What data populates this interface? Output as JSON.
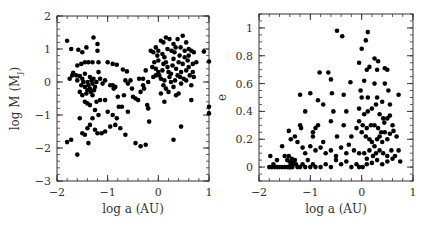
{
  "chart_data": [
    {
      "type": "scatter",
      "title": "",
      "xlabel": "log a (AU)",
      "ylabel": "log M (M_J)",
      "ylabel_main": "log M (M",
      "ylabel_sub": "J",
      "ylabel_close": ")",
      "xlim": [
        -2,
        1
      ],
      "ylim": [
        -3,
        2
      ],
      "xticks": [
        -2,
        -1,
        0,
        1
      ],
      "xtick_labels": [
        "−2",
        "−1",
        "0",
        "1"
      ],
      "yticks": [
        -3,
        -2,
        -1,
        0,
        1,
        2
      ],
      "ytick_labels": [
        "−3",
        "−2",
        "−1",
        "0",
        "1",
        "2"
      ],
      "grid": false,
      "legend": null,
      "marker_color": "#000000",
      "points": [
        [
          -1.8,
          1.25
        ],
        [
          -1.72,
          1.0
        ],
        [
          -1.58,
          0.98
        ],
        [
          -1.5,
          0.9
        ],
        [
          -1.42,
          1.05
        ],
        [
          -1.28,
          1.35
        ],
        [
          -1.2,
          1.15
        ],
        [
          -1.2,
          0.95
        ],
        [
          -1.6,
          0.5
        ],
        [
          -1.52,
          0.55
        ],
        [
          -1.45,
          0.6
        ],
        [
          -1.38,
          0.6
        ],
        [
          -1.3,
          0.6
        ],
        [
          -1.18,
          0.6
        ],
        [
          -1.0,
          0.6
        ],
        [
          -0.9,
          0.55
        ],
        [
          -0.82,
          0.52
        ],
        [
          -0.7,
          0.38
        ],
        [
          -0.62,
          0.32
        ],
        [
          -1.68,
          0.28
        ],
        [
          -1.62,
          0.2
        ],
        [
          -1.55,
          0.18
        ],
        [
          -1.5,
          0.1
        ],
        [
          -1.45,
          0.25
        ],
        [
          -1.4,
          0.0
        ],
        [
          -1.38,
          -0.1
        ],
        [
          -1.35,
          -0.2
        ],
        [
          -1.33,
          -0.3
        ],
        [
          -1.42,
          -0.35
        ],
        [
          -1.3,
          -0.05
        ],
        [
          -1.28,
          0.1
        ],
        [
          -1.25,
          -0.15
        ],
        [
          -1.35,
          0.15
        ],
        [
          -1.32,
          0.05
        ],
        [
          -1.4,
          -0.25
        ],
        [
          -1.3,
          -0.4
        ],
        [
          -1.27,
          -0.25
        ],
        [
          -1.45,
          -0.15
        ],
        [
          -1.48,
          0.0
        ],
        [
          -1.52,
          -0.1
        ],
        [
          -1.22,
          0.0
        ],
        [
          -1.18,
          0.3
        ],
        [
          -1.15,
          0.1
        ],
        [
          -1.1,
          -0.05
        ],
        [
          -1.05,
          0.05
        ],
        [
          -1.75,
          0.1
        ],
        [
          -1.7,
          0.2
        ],
        [
          -1.6,
          0.05
        ],
        [
          -1.55,
          -0.3
        ],
        [
          -1.5,
          -0.4
        ],
        [
          -1.45,
          -0.6
        ],
        [
          -1.4,
          -0.65
        ],
        [
          -1.35,
          -0.7
        ],
        [
          -1.22,
          -0.6
        ],
        [
          -1.15,
          -0.55
        ],
        [
          -1.05,
          -0.55
        ],
        [
          -0.95,
          -0.1
        ],
        [
          -0.9,
          -0.1
        ],
        [
          -0.88,
          -0.2
        ],
        [
          -0.85,
          -0.15
        ],
        [
          -0.8,
          -0.45
        ],
        [
          -0.78,
          -0.75
        ],
        [
          -0.72,
          -0.75
        ],
        [
          -0.68,
          -0.4
        ],
        [
          -0.65,
          0.05
        ],
        [
          -0.6,
          -0.05
        ],
        [
          -0.55,
          0.05
        ],
        [
          -0.52,
          -0.2
        ],
        [
          -0.5,
          -0.45
        ],
        [
          -0.45,
          -0.5
        ],
        [
          -0.4,
          -0.55
        ],
        [
          -0.38,
          0.1
        ],
        [
          -0.3,
          0.1
        ],
        [
          -0.28,
          -0.2
        ],
        [
          -0.22,
          -0.7
        ],
        [
          -0.2,
          -0.8
        ],
        [
          -0.18,
          -1.2
        ],
        [
          -0.25,
          -1.9
        ],
        [
          -0.35,
          -1.95
        ],
        [
          -0.45,
          -1.85
        ],
        [
          -0.65,
          -1.6
        ],
        [
          -0.75,
          -1.4
        ],
        [
          -0.85,
          -1.3
        ],
        [
          -0.9,
          -1.0
        ],
        [
          -0.95,
          -1.35
        ],
        [
          -1.0,
          -0.9
        ],
        [
          -1.05,
          -1.5
        ],
        [
          -1.12,
          -1.55
        ],
        [
          -1.2,
          -1.55
        ],
        [
          -1.25,
          -1.45
        ],
        [
          -1.3,
          -1.1
        ],
        [
          -1.35,
          -1.3
        ],
        [
          -1.4,
          -1.4
        ],
        [
          -1.45,
          -1.6
        ],
        [
          -1.5,
          -1.55
        ],
        [
          -1.38,
          -1.85
        ],
        [
          -1.55,
          -1.1
        ],
        [
          -1.6,
          -2.2
        ],
        [
          -1.72,
          -1.75
        ],
        [
          -1.8,
          -1.82
        ],
        [
          -1.25,
          -0.85
        ],
        [
          -1.18,
          -1.0
        ],
        [
          -0.82,
          -1.1
        ],
        [
          -0.6,
          -0.9
        ],
        [
          -0.05,
          1.05
        ],
        [
          0.0,
          0.95
        ],
        [
          0.05,
          1.25
        ],
        [
          0.1,
          1.2
        ],
        [
          0.15,
          1.35
        ],
        [
          0.22,
          1.3
        ],
        [
          0.3,
          1.15
        ],
        [
          0.38,
          1.3
        ],
        [
          0.48,
          1.4
        ],
        [
          0.55,
          1.2
        ],
        [
          0.6,
          1.0
        ],
        [
          0.65,
          0.95
        ],
        [
          0.7,
          0.9
        ],
        [
          0.9,
          0.92
        ],
        [
          1.0,
          0.62
        ],
        [
          0.75,
          0.6
        ],
        [
          0.68,
          0.55
        ],
        [
          0.6,
          0.45
        ],
        [
          -0.15,
          0.95
        ],
        [
          -0.1,
          0.9
        ],
        [
          -0.02,
          0.8
        ],
        [
          -0.08,
          0.6
        ],
        [
          -0.05,
          0.4
        ],
        [
          0.0,
          0.3
        ],
        [
          0.02,
          0.2
        ],
        [
          0.05,
          0.1
        ],
        [
          0.08,
          0.35
        ],
        [
          0.1,
          0.55
        ],
        [
          0.12,
          0.75
        ],
        [
          0.15,
          0.6
        ],
        [
          0.18,
          0.45
        ],
        [
          0.2,
          0.3
        ],
        [
          0.22,
          0.15
        ],
        [
          0.25,
          0.0
        ],
        [
          0.28,
          0.5
        ],
        [
          0.3,
          0.7
        ],
        [
          0.32,
          0.9
        ],
        [
          0.35,
          0.4
        ],
        [
          0.38,
          0.2
        ],
        [
          0.4,
          0.6
        ],
        [
          0.42,
          0.8
        ],
        [
          0.45,
          0.3
        ],
        [
          0.48,
          0.55
        ],
        [
          0.5,
          0.1
        ],
        [
          0.52,
          0.75
        ],
        [
          0.55,
          0.35
        ],
        [
          0.58,
          0.65
        ],
        [
          0.62,
          0.2
        ],
        [
          0.65,
          -0.1
        ],
        [
          0.68,
          0.3
        ],
        [
          0.1,
          -0.1
        ],
        [
          0.15,
          -0.2
        ],
        [
          0.2,
          -0.3
        ],
        [
          0.3,
          -0.15
        ],
        [
          0.35,
          -0.4
        ],
        [
          0.4,
          -0.35
        ],
        [
          0.45,
          -0.05
        ],
        [
          0.55,
          0.05
        ],
        [
          0.05,
          -0.35
        ],
        [
          -0.05,
          0.2
        ],
        [
          -0.1,
          0.15
        ],
        [
          -0.12,
          0.45
        ],
        [
          0.0,
          0.65
        ],
        [
          0.08,
          0.85
        ],
        [
          0.18,
          1.0
        ],
        [
          0.26,
          0.95
        ],
        [
          0.34,
          1.05
        ],
        [
          0.44,
          1.05
        ],
        [
          0.52,
          0.95
        ],
        [
          0.25,
          0.25
        ],
        [
          0.33,
          0.05
        ],
        [
          0.43,
          0.15
        ],
        [
          0.12,
          0.05
        ],
        [
          0.6,
          0.8
        ],
        [
          0.7,
          0.15
        ],
        [
          0.12,
          -0.6
        ],
        [
          0.65,
          -0.55
        ],
        [
          0.45,
          -1.35
        ],
        [
          0.3,
          -1.75
        ],
        [
          1.0,
          -0.75
        ],
        [
          1.0,
          -0.95
        ],
        [
          -0.3,
          -0.1
        ],
        [
          -0.35,
          -0.3
        ],
        [
          -0.2,
          0.0
        ],
        [
          -0.25,
          0.35
        ]
      ]
    },
    {
      "type": "scatter",
      "title": "",
      "xlabel": "log a (AU)",
      "ylabel": "e",
      "xlim": [
        -2,
        1
      ],
      "ylim": [
        -0.1,
        1.1
      ],
      "xticks": [
        -2,
        -1,
        0,
        1
      ],
      "xtick_labels": [
        "−2",
        "−1",
        "0",
        "1"
      ],
      "yticks": [
        0,
        0.2,
        0.4,
        0.6,
        0.8,
        1
      ],
      "ytick_labels": [
        "0",
        "0.2",
        "0.4",
        "0.6",
        "0.8",
        "1"
      ],
      "grid": false,
      "legend": null,
      "marker_color": "#000000",
      "points": [
        [
          -0.48,
          0.98
        ],
        [
          -0.38,
          0.94
        ],
        [
          0.12,
          0.97
        ],
        [
          0.08,
          0.91
        ],
        [
          0.0,
          0.85
        ],
        [
          -0.05,
          0.75
        ],
        [
          0.25,
          0.78
        ],
        [
          0.32,
          0.76
        ],
        [
          -0.82,
          0.68
        ],
        [
          -0.65,
          0.68
        ],
        [
          -0.6,
          0.63
        ],
        [
          -0.22,
          0.61
        ],
        [
          0.05,
          0.62
        ],
        [
          0.1,
          0.7
        ],
        [
          0.15,
          0.72
        ],
        [
          0.3,
          0.7
        ],
        [
          0.45,
          0.71
        ],
        [
          0.5,
          0.7
        ],
        [
          0.72,
          0.52
        ],
        [
          -1.2,
          0.52
        ],
        [
          -1.0,
          0.53
        ],
        [
          -0.58,
          0.53
        ],
        [
          -0.35,
          0.52
        ],
        [
          0.0,
          0.5
        ],
        [
          -0.85,
          0.48
        ],
        [
          -0.75,
          0.45
        ],
        [
          -0.55,
          0.4
        ],
        [
          -0.3,
          0.4
        ],
        [
          -1.1,
          0.4
        ],
        [
          -0.05,
          0.42
        ],
        [
          0.05,
          0.38
        ],
        [
          0.12,
          0.4
        ],
        [
          0.2,
          0.42
        ],
        [
          0.28,
          0.45
        ],
        [
          0.35,
          0.38
        ],
        [
          0.42,
          0.35
        ],
        [
          0.55,
          0.37
        ],
        [
          0.6,
          0.3
        ],
        [
          -1.2,
          0.3
        ],
        [
          -1.18,
          0.28
        ],
        [
          -0.9,
          0.28
        ],
        [
          -0.95,
          0.25
        ],
        [
          -0.85,
          0.3
        ],
        [
          -0.6,
          0.33
        ],
        [
          -0.35,
          0.3
        ],
        [
          -0.48,
          0.22
        ],
        [
          -0.2,
          0.22
        ],
        [
          -0.1,
          0.28
        ],
        [
          0.0,
          0.25
        ],
        [
          0.08,
          0.22
        ],
        [
          0.15,
          0.2
        ],
        [
          0.2,
          0.18
        ],
        [
          0.25,
          0.15
        ],
        [
          0.3,
          0.2
        ],
        [
          0.35,
          0.22
        ],
        [
          0.4,
          0.18
        ],
        [
          0.45,
          0.25
        ],
        [
          0.5,
          0.2
        ],
        [
          0.55,
          0.24
        ],
        [
          0.62,
          0.26
        ],
        [
          0.68,
          0.22
        ],
        [
          0.72,
          0.12
        ],
        [
          0.75,
          0.04
        ],
        [
          -1.42,
          0.26
        ],
        [
          -1.38,
          0.2
        ],
        [
          -1.3,
          0.22
        ],
        [
          -1.25,
          0.18
        ],
        [
          -1.15,
          0.14
        ],
        [
          -1.1,
          0.1
        ],
        [
          -1.0,
          0.15
        ],
        [
          -0.9,
          0.12
        ],
        [
          -0.8,
          0.14
        ],
        [
          -0.7,
          0.1
        ],
        [
          -0.6,
          0.12
        ],
        [
          -0.5,
          0.08
        ],
        [
          -0.4,
          0.14
        ],
        [
          -0.3,
          0.1
        ],
        [
          -0.25,
          0.16
        ],
        [
          -0.15,
          0.12
        ],
        [
          -0.05,
          0.1
        ],
        [
          0.05,
          0.1
        ],
        [
          0.1,
          0.06
        ],
        [
          0.15,
          0.12
        ],
        [
          0.22,
          0.08
        ],
        [
          0.28,
          0.1
        ],
        [
          0.35,
          0.12
        ],
        [
          0.42,
          0.1
        ],
        [
          0.5,
          0.08
        ],
        [
          0.58,
          0.12
        ],
        [
          0.65,
          0.08
        ],
        [
          -1.78,
          0.08
        ],
        [
          -1.72,
          0.02
        ],
        [
          -1.65,
          0.05
        ],
        [
          -1.55,
          0.15
        ],
        [
          -1.5,
          0.08
        ],
        [
          -1.45,
          0.05
        ],
        [
          -1.42,
          0.08
        ],
        [
          -1.4,
          0.04
        ],
        [
          -1.38,
          0.02
        ],
        [
          -1.36,
          0.06
        ],
        [
          -1.35,
          0.0
        ],
        [
          -1.33,
          0.03
        ],
        [
          -1.3,
          0.05
        ],
        [
          -1.28,
          0.02
        ],
        [
          -1.8,
          0.0
        ],
        [
          -1.75,
          0.0
        ],
        [
          -1.7,
          0.0
        ],
        [
          -1.65,
          0.0
        ],
        [
          -1.6,
          0.0
        ],
        [
          -1.55,
          0.0
        ],
        [
          -1.5,
          0.0
        ],
        [
          -1.45,
          0.0
        ],
        [
          -1.42,
          0.0
        ],
        [
          -1.4,
          0.0
        ],
        [
          -1.38,
          0.0
        ],
        [
          -1.35,
          0.02
        ],
        [
          -1.25,
          0.0
        ],
        [
          -1.2,
          0.0
        ],
        [
          -1.15,
          0.02
        ],
        [
          -1.1,
          0.0
        ],
        [
          -1.05,
          0.05
        ],
        [
          -1.0,
          0.0
        ],
        [
          -0.95,
          0.02
        ],
        [
          -0.9,
          0.0
        ],
        [
          -0.8,
          0.0
        ],
        [
          -0.7,
          0.02
        ],
        [
          -0.6,
          0.0
        ],
        [
          -0.5,
          0.05
        ],
        [
          -0.4,
          0.02
        ],
        [
          -0.3,
          0.04
        ],
        [
          -0.2,
          0.0
        ],
        [
          -0.1,
          0.02
        ],
        [
          -0.05,
          0.0
        ],
        [
          0.02,
          0.0
        ],
        [
          0.1,
          0.02
        ],
        [
          0.2,
          0.03
        ],
        [
          0.3,
          0.05
        ],
        [
          0.4,
          0.02
        ],
        [
          0.5,
          0.04
        ],
        [
          0.6,
          0.06
        ],
        [
          -0.95,
          0.22
        ],
        [
          -0.75,
          0.18
        ],
        [
          -0.05,
          0.33
        ],
        [
          0.02,
          0.3
        ],
        [
          0.1,
          0.28
        ],
        [
          0.18,
          0.3
        ],
        [
          0.25,
          0.3
        ],
        [
          0.32,
          0.28
        ],
        [
          0.38,
          0.25
        ],
        [
          0.44,
          0.32
        ],
        [
          0.5,
          0.35
        ],
        [
          0.3,
          0.5
        ],
        [
          0.4,
          0.47
        ],
        [
          0.25,
          0.6
        ],
        [
          0.45,
          0.6
        ],
        [
          0.52,
          0.55
        ],
        [
          0.12,
          0.5
        ],
        [
          -0.02,
          0.55
        ],
        [
          0.55,
          0.45
        ]
      ]
    }
  ]
}
